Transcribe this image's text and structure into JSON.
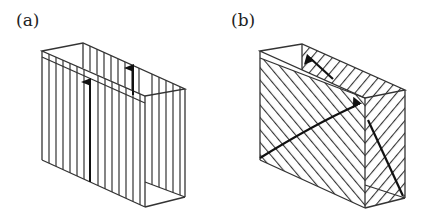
{
  "figure": {
    "panels": [
      {
        "label": "(a)",
        "description": "Box-shaped wall section with vertical hatching and two upward arrows"
      },
      {
        "label": "(b)",
        "description": "Box-shaped wall section with diagonal hatching and three diagonal arrows"
      }
    ],
    "colors": {
      "stroke": "#333333",
      "arrow": "#111111",
      "background": "#ffffff"
    }
  }
}
